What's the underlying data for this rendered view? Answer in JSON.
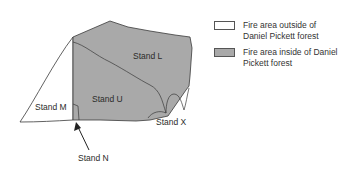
{
  "diagram": {
    "stands": [
      {
        "id": "M",
        "label": "Stand M"
      },
      {
        "id": "U",
        "label": "Stand U"
      },
      {
        "id": "L",
        "label": "Stand L"
      },
      {
        "id": "X",
        "label": "Stand X"
      },
      {
        "id": "N",
        "label": "Stand N"
      }
    ],
    "colors": {
      "outside_fill": "#ffffff",
      "inside_fill": "#a9a9a9",
      "outline": "#3a3a3a"
    }
  },
  "legend": {
    "items": [
      {
        "label": "Fire area outside of Daniel Pickett forest",
        "color": "#ffffff"
      },
      {
        "label": "Fire area inside of Daniel Pickett forest",
        "color": "#a9a9a9"
      }
    ]
  }
}
